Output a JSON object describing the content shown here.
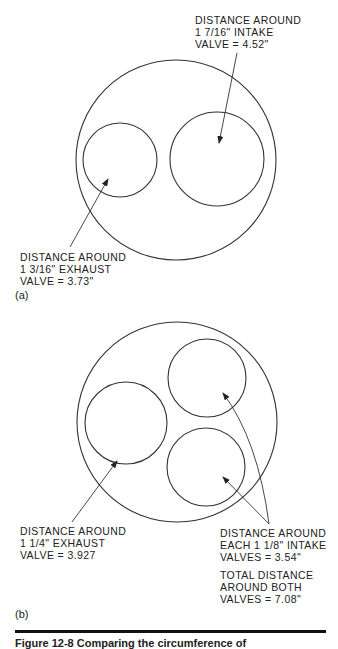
{
  "figure": {
    "panel_a": {
      "tag": "(a)",
      "intake_label": [
        "DISTANCE AROUND",
        "1 7/16\" INTAKE",
        "VALVE = 4.52\""
      ],
      "exhaust_label": [
        "DISTANCE AROUND",
        "1 3/16\" EXHAUST",
        "VALVE = 3.73\""
      ]
    },
    "panel_b": {
      "tag": "(b)",
      "exhaust_label": [
        "DISTANCE AROUND",
        "1 1/4\" EXHAUST",
        "VALVE = 3.927"
      ],
      "intake_label": [
        "DISTANCE AROUND",
        "EACH 1 1/8\" INTAKE",
        "VALVES = 3.54\""
      ],
      "total_label": [
        "TOTAL DISTANCE",
        "AROUND BOTH",
        "VALVES = 7.08\""
      ]
    },
    "caption": "Figure 12-8  Comparing the circumference of"
  }
}
